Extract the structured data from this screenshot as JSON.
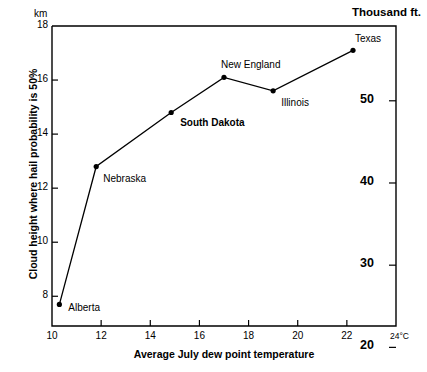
{
  "chart_data": {
    "type": "line",
    "title": "",
    "xlabel": "Average July dew point temperature",
    "ylabel": "Cloud height where hail probability is 50%",
    "x_unit": "24°C",
    "y_unit_left": "km",
    "y_unit_right": "Thousand ft.",
    "xlim": [
      10,
      24
    ],
    "ylim": [
      6.9,
      18
    ],
    "right_ylim": [
      22.6,
      59.1
    ],
    "grid": false,
    "legend": null,
    "x_ticks": [
      "10",
      "12",
      "14",
      "16",
      "18",
      "20",
      "22"
    ],
    "x_tick_values": [
      10,
      12,
      14,
      16,
      18,
      20,
      22
    ],
    "y_ticks_left": [
      "18",
      "16",
      "14",
      "12",
      "10",
      "8"
    ],
    "y_tick_values_left": [
      18,
      16,
      14,
      12,
      10,
      8
    ],
    "y_ticks_right": [
      "50",
      "40",
      "30",
      "20"
    ],
    "y_tick_values_right": [
      50,
      40,
      30,
      20
    ],
    "points": [
      {
        "label": "Alberta",
        "x": 10.3,
        "y": 7.7,
        "bold": false,
        "label_dx": 9,
        "label_dy": 4
      },
      {
        "label": "Nebraska",
        "x": 11.8,
        "y": 12.8,
        "bold": false,
        "label_dx": 7,
        "label_dy": 12
      },
      {
        "label": "South Dakota",
        "x": 14.85,
        "y": 14.8,
        "bold": true,
        "label_dx": 9,
        "label_dy": 11
      },
      {
        "label": "New England",
        "x": 17.0,
        "y": 16.1,
        "bold": false,
        "label_dx": -3,
        "label_dy": -12
      },
      {
        "label": "Illinois",
        "x": 19.0,
        "y": 15.6,
        "bold": false,
        "label_dx": 8,
        "label_dy": 12
      },
      {
        "label": "Texas",
        "x": 22.25,
        "y": 17.1,
        "bold": false,
        "label_dx": 2,
        "label_dy": -11
      }
    ],
    "marker": "filled-circle",
    "line_color": "#000000",
    "marker_color": "#000000",
    "axis_color": "#000000",
    "background": "#ffffff"
  }
}
